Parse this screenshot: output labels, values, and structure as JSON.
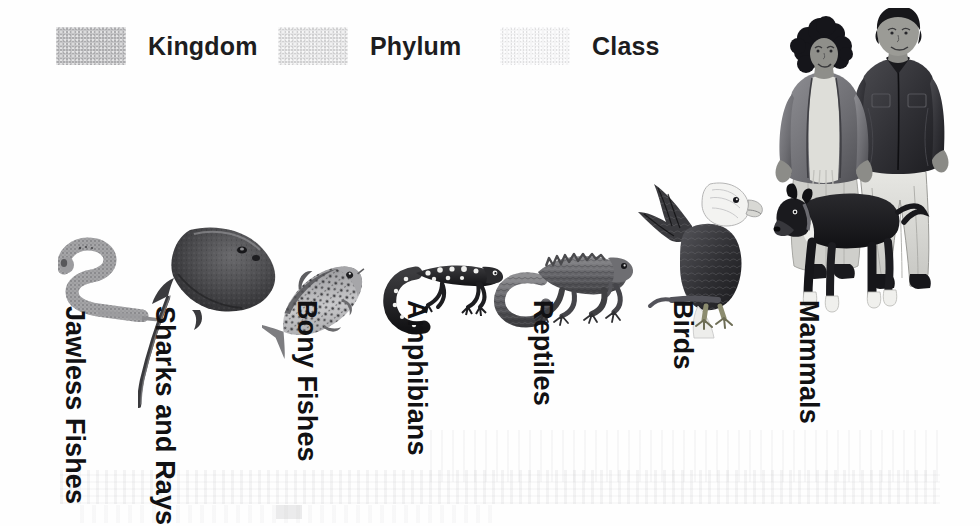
{
  "figure": {
    "background_color": "#ffffff"
  },
  "legend": {
    "items": [
      {
        "label": "Kingdom",
        "color": "#c6c6c8",
        "swatch_name": "kingdom-swatch"
      },
      {
        "label": "Phylum",
        "color": "#e6e6e7",
        "swatch_name": "phylum-swatch"
      },
      {
        "label": "Class",
        "color": "#f4f4f5",
        "swatch_name": "class-swatch"
      }
    ]
  },
  "groups": [
    {
      "label": "Jawless Fishes",
      "organism": "lamprey-illustration"
    },
    {
      "label": "Sharks and Rays",
      "organism": "stingray-illustration"
    },
    {
      "label": "Bony Fishes",
      "organism": "trout-illustration"
    },
    {
      "label": "Amphibians",
      "organism": "salamander-illustration"
    },
    {
      "label": "Reptiles",
      "organism": "iguana-illustration"
    },
    {
      "label": "Birds",
      "organism": "eagle-illustration"
    },
    {
      "label": "Mammals",
      "organism": "humans-and-dog-illustration"
    }
  ],
  "colors": {
    "label_text": "#111113",
    "legend_text": "#1d1d1f",
    "ink_dark": "#2b2b2d",
    "ink_mid": "#6e6e72",
    "ink_light": "#b8b8bb"
  }
}
